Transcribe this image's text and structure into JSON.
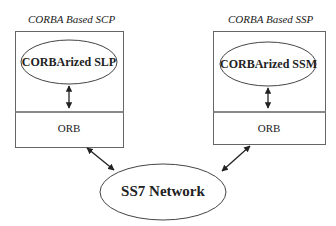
{
  "left_node": {
    "title": "CORBA Based SCP",
    "component": "CORBArized SLP",
    "orb_label": "ORB"
  },
  "right_node": {
    "title": "CORBA Based SSP",
    "component": "CORBArized SSM",
    "orb_label": "ORB"
  },
  "network": {
    "label": "SS7 Network"
  },
  "edges": [
    {
      "from": "CORBArized SLP",
      "to": "ORB (SCP)",
      "type": "bidirectional"
    },
    {
      "from": "CORBArized SSM",
      "to": "ORB (SSP)",
      "type": "bidirectional"
    },
    {
      "from": "ORB (SCP)",
      "to": "SS7 Network",
      "type": "bidirectional"
    },
    {
      "from": "ORB (SSP)",
      "to": "SS7 Network",
      "type": "bidirectional"
    }
  ]
}
